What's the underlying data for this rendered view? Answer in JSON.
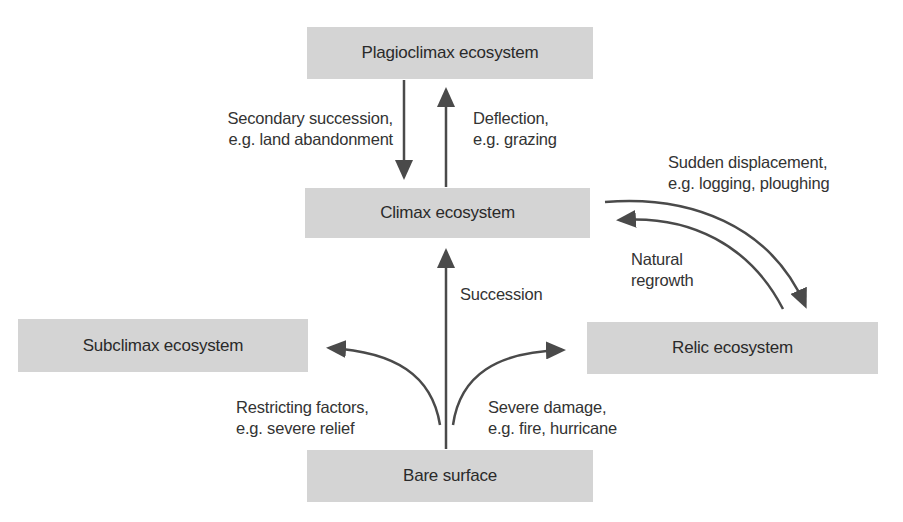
{
  "diagram": {
    "type": "flow",
    "colors": {
      "box_fill": "#d4d4d4",
      "arrow": "#4a4a4a",
      "text": "#2b2b2b"
    },
    "nodes": {
      "plagioclimax": "Plagioclimax ecosystem",
      "climax": "Climax ecosystem",
      "subclimax": "Subclimax ecosystem",
      "relic": "Relic ecosystem",
      "bare": "Bare surface"
    },
    "edges": {
      "secondary_succession": {
        "from": "Plagioclimax ecosystem",
        "to": "Climax ecosystem",
        "line1": "Secondary succession,",
        "line2": "e.g. land abandonment"
      },
      "deflection": {
        "from": "Climax ecosystem",
        "to": "Plagioclimax ecosystem",
        "line1": "Deflection,",
        "line2": "e.g. grazing"
      },
      "sudden_displacement": {
        "from": "Climax ecosystem",
        "to": "Relic ecosystem",
        "line1": "Sudden displacement,",
        "line2": "e.g. logging, ploughing"
      },
      "natural_regrowth": {
        "from": "Relic ecosystem",
        "to": "Climax ecosystem",
        "line1": "Natural",
        "line2": "regrowth"
      },
      "succession": {
        "from": "Bare surface",
        "to": "Climax ecosystem",
        "line1": "Succession"
      },
      "restricting_factors": {
        "from": "Bare surface",
        "to": "Subclimax ecosystem",
        "line1": "Restricting factors,",
        "line2": "e.g. severe relief"
      },
      "severe_damage": {
        "from": "Bare surface",
        "to": "Relic ecosystem",
        "line1": "Severe damage,",
        "line2": "e.g. fire, hurricane"
      }
    }
  }
}
